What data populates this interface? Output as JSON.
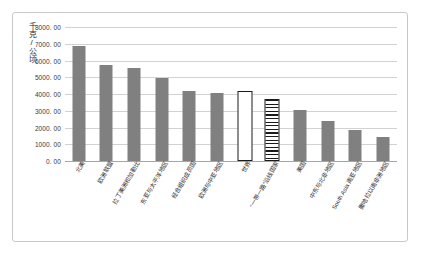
{
  "chart_data": {
    "type": "bar",
    "title": "",
    "subtitle": "",
    "xlabel": "",
    "ylabel": "千克/公顷",
    "ylim": [
      0,
      8000
    ],
    "ytick_step": 1000,
    "ytick_labels": [
      "8000. 00",
      "7000. 00",
      "6000. 00",
      "5000. 00",
      "4000. 00",
      "3000. 00",
      "2000. 00",
      "1000. 00",
      "0. 00"
    ],
    "grid": true,
    "legend": "none",
    "bar_color": "#808080",
    "gridline_color": "#d2d2d2",
    "categories": [
      "北美",
      "欧洲联盟",
      "拉丁美洲和加勒比",
      "东亚与太平洋地区",
      "经合组织成员国",
      "欧洲与中亚地区",
      "世界",
      "“一带一路”沿线国家",
      "美国",
      "中东与北非地区",
      "South Asia 南亚地区",
      "撒哈拉以南非洲地区"
    ],
    "values": [
      6850,
      5730,
      5570,
      4980,
      4170,
      4060,
      4060,
      3580,
      3020,
      2400,
      1880,
      1440
    ],
    "patterns": [
      "solid",
      "solid",
      "solid",
      "solid",
      "solid",
      "solid",
      "dotted",
      "striped",
      "solid",
      "solid",
      "solid",
      "solid"
    ],
    "highlighted": [
      "世界",
      "“一带一路”沿线国家"
    ]
  }
}
